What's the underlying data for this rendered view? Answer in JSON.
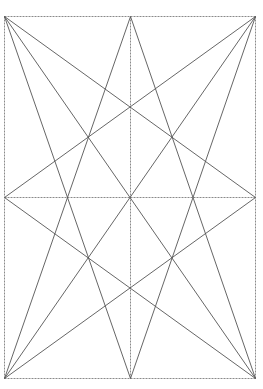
{
  "diagram": {
    "title": "",
    "width": 263,
    "height": 389,
    "background": "#ffffff",
    "colors": {
      "construction_line": "#8a8a8a",
      "diagonal_line": "#555555"
    },
    "points": {
      "TL": [
        4,
        16
      ],
      "TM": [
        130,
        16
      ],
      "TR": [
        255,
        16
      ],
      "LM": [
        4,
        197
      ],
      "C": [
        130,
        197
      ],
      "RM": [
        255,
        197
      ],
      "BL": [
        4,
        378
      ],
      "BM": [
        130,
        378
      ],
      "BR": [
        255,
        378
      ]
    },
    "construction_lines": [
      {
        "name": "border-top",
        "from": "TL",
        "to": "TR"
      },
      {
        "name": "border-right",
        "from": "TR",
        "to": "BR"
      },
      {
        "name": "border-bottom",
        "from": "BR",
        "to": "BL"
      },
      {
        "name": "border-left",
        "from": "BL",
        "to": "TL"
      },
      {
        "name": "center-vertical",
        "from": "TM",
        "to": "BM"
      },
      {
        "name": "center-horizontal",
        "from": "LM",
        "to": "RM"
      }
    ],
    "diagonal_lines": [
      {
        "name": "tl-to-rm",
        "from": "TL",
        "to": "RM"
      },
      {
        "name": "tl-to-br",
        "from": "TL",
        "to": "BR"
      },
      {
        "name": "tl-to-bm",
        "from": "TL",
        "to": "BM"
      },
      {
        "name": "tr-to-lm",
        "from": "TR",
        "to": "LM"
      },
      {
        "name": "tr-to-bl",
        "from": "TR",
        "to": "BL"
      },
      {
        "name": "tr-to-bm",
        "from": "TR",
        "to": "BM"
      },
      {
        "name": "bl-to-rm",
        "from": "BL",
        "to": "RM"
      },
      {
        "name": "bl-to-tm",
        "from": "BL",
        "to": "TM"
      },
      {
        "name": "br-to-lm",
        "from": "BR",
        "to": "LM"
      },
      {
        "name": "br-to-tm",
        "from": "BR",
        "to": "TM"
      }
    ]
  }
}
